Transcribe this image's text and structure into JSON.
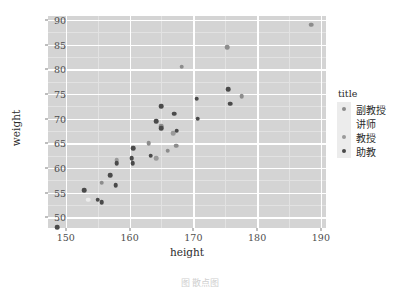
{
  "figure": {
    "caption": "图 散点图",
    "background": "#ffffff",
    "panel_background": "#d4d4d4",
    "grid_color": "#ffffff"
  },
  "legend": {
    "title": "title",
    "position": "right",
    "entries": [
      {
        "label": "副教授",
        "color": "#8c8c8c"
      },
      {
        "label": "讲师",
        "color": "#ececec"
      },
      {
        "label": "教授",
        "color": "#9a9a9a"
      },
      {
        "label": "助教",
        "color": "#4a4a4a"
      }
    ]
  },
  "chart_data": {
    "type": "scatter",
    "title": "",
    "xlabel": "height",
    "ylabel": "weight",
    "xlim": [
      147.2,
      190.8
    ],
    "ylim": [
      47.8,
      90.8
    ],
    "xticks": [
      150,
      160,
      170,
      180,
      190
    ],
    "yticks": [
      50,
      55,
      60,
      65,
      70,
      75,
      80,
      85,
      90
    ],
    "grid": true,
    "legend_position": "right",
    "series": [
      {
        "name": "副教授",
        "color": "#8c8c8c",
        "points": [
          {
            "x": 155.6,
            "y": 57.0
          },
          {
            "x": 163.0,
            "y": 65.0
          },
          {
            "x": 165.0,
            "y": 68.5
          },
          {
            "x": 166.0,
            "y": 63.5
          },
          {
            "x": 167.3,
            "y": 64.5
          },
          {
            "x": 168.2,
            "y": 80.5
          },
          {
            "x": 175.3,
            "y": 84.5
          },
          {
            "x": 177.6,
            "y": 74.5
          },
          {
            "x": 188.5,
            "y": 89.0
          }
        ]
      },
      {
        "name": "讲师",
        "color": "#ececec",
        "points": [
          {
            "x": 153.5,
            "y": 53.5
          }
        ]
      },
      {
        "name": "教授",
        "color": "#9a9a9a",
        "points": [
          {
            "x": 158.0,
            "y": 61.5
          },
          {
            "x": 164.2,
            "y": 62.0
          },
          {
            "x": 166.8,
            "y": 67.0
          }
        ]
      },
      {
        "name": "助教",
        "color": "#4a4a4a",
        "points": [
          {
            "x": 148.6,
            "y": 48.0
          },
          {
            "x": 152.9,
            "y": 55.5
          },
          {
            "x": 155.0,
            "y": 53.5
          },
          {
            "x": 155.6,
            "y": 53.0
          },
          {
            "x": 157.0,
            "y": 58.5
          },
          {
            "x": 157.8,
            "y": 56.5
          },
          {
            "x": 158.0,
            "y": 61.0
          },
          {
            "x": 160.3,
            "y": 62.0
          },
          {
            "x": 160.5,
            "y": 61.0
          },
          {
            "x": 160.6,
            "y": 64.0
          },
          {
            "x": 163.3,
            "y": 62.5
          },
          {
            "x": 164.2,
            "y": 69.5
          },
          {
            "x": 165.0,
            "y": 72.5
          },
          {
            "x": 165.0,
            "y": 68.0
          },
          {
            "x": 167.0,
            "y": 71.0
          },
          {
            "x": 167.4,
            "y": 67.5
          },
          {
            "x": 170.5,
            "y": 74.0
          },
          {
            "x": 170.7,
            "y": 70.0
          },
          {
            "x": 175.5,
            "y": 76.0
          },
          {
            "x": 175.8,
            "y": 73.0
          }
        ]
      }
    ]
  }
}
